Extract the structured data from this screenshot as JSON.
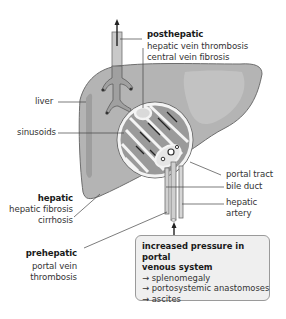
{
  "diagram": {
    "labels": {
      "posthepatic": {
        "title": "posthepatic",
        "lines": [
          "hepatic vein thrombosis",
          "central vein fibrosis"
        ]
      },
      "liver": "liver",
      "sinusoids": "sinusoids",
      "portal_tract": "portal tract",
      "bile_duct": "bile duct",
      "hepatic_artery": [
        "hepatic",
        "artery"
      ],
      "hepatic": {
        "title": "hepatic",
        "lines": [
          "hepatic fibrosis",
          "cirrhosis"
        ]
      },
      "prehepatic": {
        "title": "prehepatic",
        "lines": [
          "portal vein",
          "thrombosis"
        ]
      }
    },
    "infobox": {
      "title_lines": [
        "increased pressure in portal",
        "venous system"
      ],
      "items": [
        "→ splenomegaly",
        "→ portosystemic anastomoses",
        "→ ascites"
      ]
    },
    "colors": {
      "liver_fill": "#b4b4b4",
      "liver_outline": "#6e6e6e",
      "lobule_fill": "#f4f4f4",
      "infobox_bg": "#efefef",
      "text": "#333333"
    }
  }
}
